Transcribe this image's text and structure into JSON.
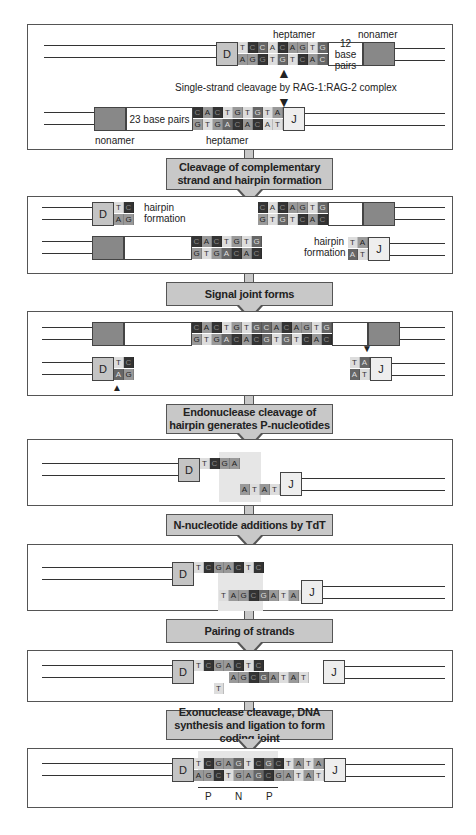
{
  "steps": [
    "Cleavage of complementary strand and hairpin formation",
    "Signal joint forms",
    "Endonuclease cleavage of hairpin generates P-nucleotides",
    "N-nucleotide additions by TdT",
    "Pairing of strands",
    "Exonuclease cleavage, DNA synthesis and ligation to form coding joint"
  ],
  "panel1": {
    "heptamer_label_top": "heptamer",
    "nonamer_label_top": "nonamer",
    "spacer_top": "12 base pairs",
    "cleavage_label": "Single-strand cleavage by RAG-1:RAG-2 complex",
    "spacer_bottom": "23 base pairs",
    "nonamer_label_bottom": "nonamer",
    "heptamer_label_bottom": "heptamer",
    "top_seq_upper": "TCCACAGTG",
    "top_seq_lower": "AGGTGTCAC",
    "bottom_seq_upper": "CACTGTGTA",
    "bottom_seq_lower": "GTGACACAT"
  },
  "panel2": {
    "hairpin_label_d": "hairpin formation",
    "hairpin_label_j": "hairpin formation"
  },
  "panel7": {
    "labels": [
      "P",
      "N",
      "P"
    ],
    "upper": "TCGAGTCGCTATA",
    "lower": "AGCTGAGCGATAT"
  },
  "gene_labels": {
    "d": "D",
    "j": "J"
  }
}
